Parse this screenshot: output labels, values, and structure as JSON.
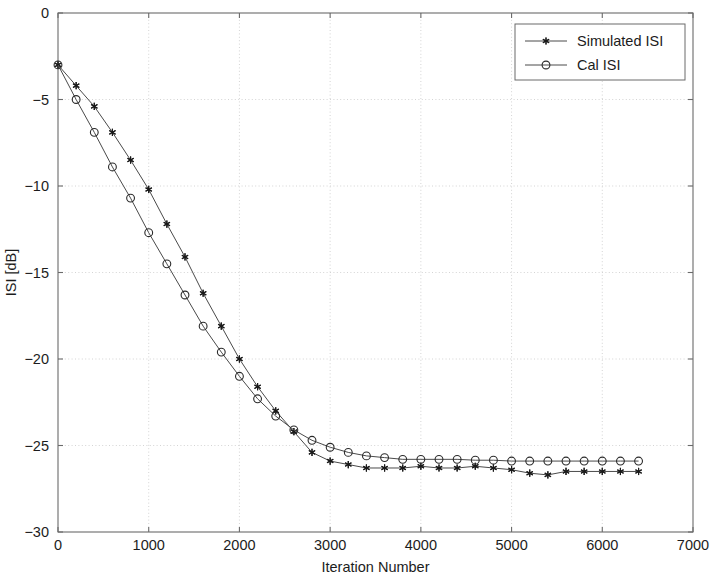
{
  "chart_data": {
    "type": "line",
    "title": "",
    "xlabel": "Iteration Number",
    "ylabel": "ISI [dB]",
    "xlim": [
      0,
      7000
    ],
    "ylim": [
      -30,
      0
    ],
    "xticks": [
      0,
      1000,
      2000,
      3000,
      4000,
      5000,
      6000,
      7000
    ],
    "xtick_labels": [
      "0",
      "1000",
      "2000",
      "3000",
      "4000",
      "5000",
      "6000",
      "7000"
    ],
    "yticks": [
      -30,
      -25,
      -20,
      -15,
      -10,
      -5,
      0
    ],
    "ytick_labels": [
      "-30",
      "-25",
      "-20",
      "-15",
      "-10",
      "-5",
      "0"
    ],
    "grid": true,
    "grid_style": "dotted",
    "legend_position": "top-right",
    "x": [
      0,
      200,
      400,
      600,
      800,
      1000,
      1200,
      1400,
      1600,
      1800,
      2000,
      2200,
      2400,
      2600,
      2800,
      3000,
      3200,
      3400,
      3600,
      3800,
      4000,
      4200,
      4400,
      4600,
      4800,
      5000,
      5200,
      5400,
      5600,
      5800,
      6000,
      6200,
      6400
    ],
    "series": [
      {
        "name": "Simulated ISI",
        "marker": "star",
        "values": [
          -3.0,
          -4.2,
          -5.4,
          -6.9,
          -8.5,
          -10.2,
          -12.2,
          -14.1,
          -16.2,
          -18.1,
          -20.0,
          -21.6,
          -23.0,
          -24.2,
          -25.4,
          -25.9,
          -26.1,
          -26.3,
          -26.3,
          -26.3,
          -26.2,
          -26.3,
          -26.3,
          -26.2,
          -26.3,
          -26.4,
          -26.6,
          -26.7,
          -26.5,
          -26.5,
          -26.5,
          -26.5,
          -26.5
        ]
      },
      {
        "name": "Cal ISI",
        "marker": "circle",
        "values": [
          -3.0,
          -5.0,
          -6.9,
          -8.9,
          -10.7,
          -12.7,
          -14.5,
          -16.3,
          -18.1,
          -19.6,
          -21.0,
          -22.3,
          -23.3,
          -24.1,
          -24.7,
          -25.1,
          -25.4,
          -25.6,
          -25.7,
          -25.8,
          -25.8,
          -25.8,
          -25.8,
          -25.85,
          -25.85,
          -25.9,
          -25.9,
          -25.9,
          -25.9,
          -25.9,
          -25.9,
          -25.9,
          -25.9
        ]
      }
    ]
  },
  "legend": {
    "entries": [
      {
        "label": "Simulated ISI",
        "marker": "star-icon"
      },
      {
        "label": "Cal ISI",
        "marker": "circle-icon"
      }
    ]
  },
  "colors": {
    "line": "#4a4a4a",
    "marker": "#1a1a1a",
    "grid": "#cfcfcf",
    "axis": "#6b6b6b",
    "text": "#1c1c1c",
    "background": "#ffffff"
  }
}
